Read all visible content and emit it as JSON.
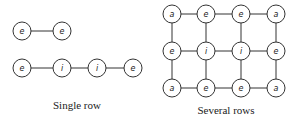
{
  "diagrams": [
    {
      "id": "single-row",
      "caption": "Single row",
      "caption_pos": [
        77,
        109
      ],
      "nodes": [
        {
          "label": "e",
          "x": 22,
          "y": 31
        },
        {
          "label": "e",
          "x": 62,
          "y": 31
        },
        {
          "label": "e",
          "x": 22,
          "y": 68
        },
        {
          "label": "i",
          "x": 62,
          "y": 68
        },
        {
          "label": "i",
          "x": 97,
          "y": 68
        },
        {
          "label": "e",
          "x": 133,
          "y": 68
        }
      ],
      "edges": [
        [
          0,
          1
        ],
        [
          2,
          3
        ],
        [
          3,
          4
        ],
        [
          4,
          5
        ]
      ]
    },
    {
      "id": "several-rows",
      "caption": "Several rows",
      "caption_pos": [
        226,
        114
      ],
      "nodes": [
        {
          "label": "a",
          "x": 172,
          "y": 14
        },
        {
          "label": "e",
          "x": 206,
          "y": 14
        },
        {
          "label": "e",
          "x": 241,
          "y": 14
        },
        {
          "label": "a",
          "x": 276,
          "y": 14
        },
        {
          "label": "e",
          "x": 172,
          "y": 51
        },
        {
          "label": "i",
          "x": 206,
          "y": 51
        },
        {
          "label": "i",
          "x": 241,
          "y": 51
        },
        {
          "label": "e",
          "x": 276,
          "y": 51
        },
        {
          "label": "a",
          "x": 172,
          "y": 88
        },
        {
          "label": "e",
          "x": 206,
          "y": 88
        },
        {
          "label": "e",
          "x": 241,
          "y": 88
        },
        {
          "label": "a",
          "x": 276,
          "y": 88
        }
      ],
      "edges": [
        [
          0,
          1
        ],
        [
          1,
          2
        ],
        [
          2,
          3
        ],
        [
          4,
          5
        ],
        [
          5,
          6
        ],
        [
          6,
          7
        ],
        [
          8,
          9
        ],
        [
          9,
          10
        ],
        [
          10,
          11
        ],
        [
          0,
          4
        ],
        [
          4,
          8
        ],
        [
          1,
          5
        ],
        [
          5,
          9
        ],
        [
          2,
          6
        ],
        [
          6,
          10
        ],
        [
          3,
          7
        ],
        [
          7,
          11
        ]
      ]
    }
  ],
  "node_radius": 9
}
